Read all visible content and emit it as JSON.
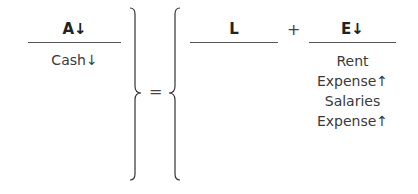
{
  "equation": {
    "assets": {
      "header": "A↓",
      "items": [
        "Cash↓"
      ]
    },
    "equals": "=",
    "liabilities": {
      "header": "L",
      "items": []
    },
    "plus": "+",
    "equity": {
      "header": "E↓",
      "items": [
        "Rent",
        "Expense↑",
        "Salaries",
        "Expense↑"
      ]
    }
  }
}
